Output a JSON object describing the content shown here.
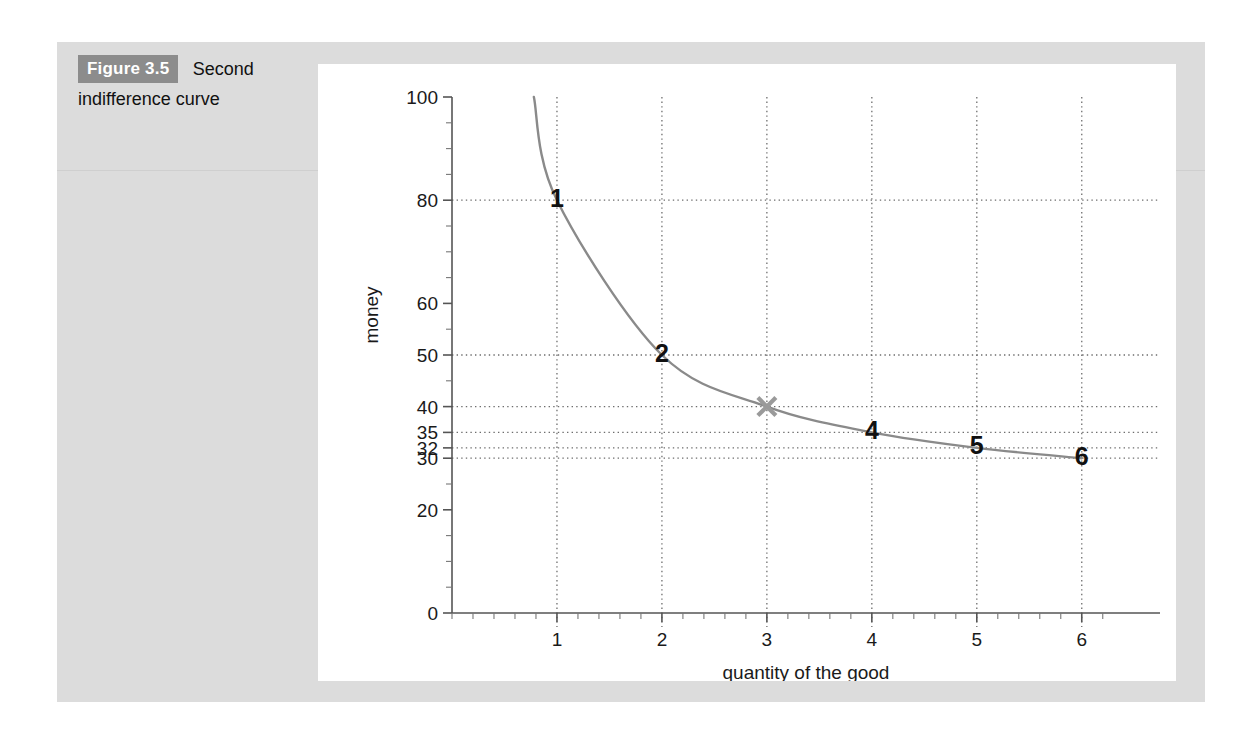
{
  "caption": {
    "badge": "Figure 3.5",
    "line1": "Second",
    "line2": "indifference curve"
  },
  "colors": {
    "panel_gray": "#dcdcdc",
    "badge_gray": "#8c8c8c",
    "card_white": "#ffffff",
    "curve_gray": "#8a8a8a",
    "marker_gray": "#9a9a9a",
    "axis_gray": "#555555",
    "grid_gray": "#6e6e6e",
    "text_black": "#111111"
  },
  "chart_data": {
    "type": "line",
    "title": "",
    "subtitle": "",
    "xlabel": "quantity of the good",
    "ylabel": "money",
    "xlim": [
      0,
      6.25
    ],
    "ylim": [
      0,
      100
    ],
    "grid": true,
    "legend": null,
    "x_ticks": [
      1,
      2,
      3,
      4,
      5,
      6
    ],
    "x_tick_labels": [
      "1",
      "2",
      "3",
      "4",
      "5",
      "6"
    ],
    "x_minor_tick_step": 0.2,
    "y_ticks": [
      0,
      20,
      30,
      32,
      35,
      40,
      50,
      60,
      80,
      100
    ],
    "y_tick_labels": [
      "0",
      "20",
      "30",
      "32",
      "35",
      "40",
      "50",
      "60",
      "80",
      "100"
    ],
    "y_minor_tick_step": 5,
    "y_gridlines": [
      30,
      32,
      35,
      40,
      50,
      80
    ],
    "x_gridlines": [
      1,
      2,
      3,
      4,
      5,
      6
    ],
    "series": [
      {
        "name": "indifference curve",
        "x": [
          1,
          2,
          3,
          4,
          5,
          6
        ],
        "values": [
          80,
          50,
          40,
          35,
          32,
          30
        ]
      }
    ],
    "curve_start": {
      "x": 0.78,
      "y": 100
    },
    "point_labels": [
      {
        "label": "1",
        "x": 1,
        "y": 80
      },
      {
        "label": "2",
        "x": 2,
        "y": 50
      },
      {
        "label": "4",
        "x": 4,
        "y": 35
      },
      {
        "label": "5",
        "x": 5,
        "y": 32
      },
      {
        "label": "6",
        "x": 6,
        "y": 30
      }
    ],
    "markers": [
      {
        "symbol": "x",
        "x": 3,
        "y": 40
      }
    ],
    "annotations": []
  }
}
